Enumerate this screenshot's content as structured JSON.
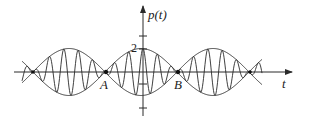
{
  "diagram": {
    "y_axis_label": "p(t)",
    "x_axis_label": "t",
    "amplitude_label": "2",
    "node_labels": [
      "A",
      "B"
    ],
    "colors": {
      "stroke": "#2a2a2a",
      "background": "#ffffff"
    }
  },
  "chart_data": {
    "type": "line",
    "title": "",
    "xlabel": "t",
    "ylabel": "p(t)",
    "ylim": [
      -2,
      2
    ],
    "annotations": [
      "2",
      "A",
      "B"
    ],
    "series": [
      {
        "name": "envelope upper",
        "description": "|2cos| envelope, peak 2"
      },
      {
        "name": "envelope lower",
        "description": "-|2cos| envelope, trough -2"
      },
      {
        "name": "carrier",
        "description": "fast oscillation within envelope, zero at nodes A and B"
      }
    ],
    "grid": false,
    "legend": "none"
  }
}
